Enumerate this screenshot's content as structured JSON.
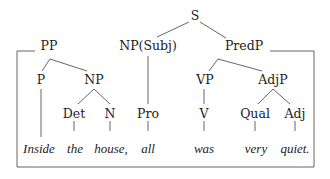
{
  "tree": {
    "root": {
      "label": "S"
    },
    "nodes": {
      "np_subj": {
        "label": "NP(Subj)"
      },
      "predp": {
        "label": "PredP"
      },
      "pp": {
        "label": "PP"
      },
      "p": {
        "label": "P"
      },
      "np": {
        "label": "NP"
      },
      "vp": {
        "label": "VP"
      },
      "adjp": {
        "label": "AdjP"
      },
      "det": {
        "label": "Det"
      },
      "n": {
        "label": "N"
      },
      "pro": {
        "label": "Pro"
      },
      "v": {
        "label": "V"
      },
      "qual": {
        "label": "Qual"
      },
      "adj": {
        "label": "Adj"
      }
    },
    "words": {
      "w1": "Inside",
      "w2": "the",
      "w3": "house,",
      "w4": "all",
      "w5": "was",
      "w6": "very",
      "w7": "quiet."
    }
  }
}
